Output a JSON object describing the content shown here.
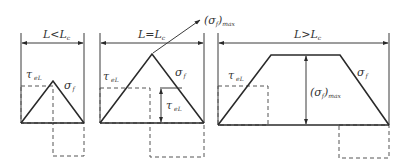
{
  "panels": [
    {
      "id": "short",
      "dimension_label": "L<L",
      "dimension_sub": "c",
      "tau_label": "τ",
      "tau_sub": "eL",
      "sigma_label": "σ",
      "sigma_sub": "f",
      "shape": "triangle"
    },
    {
      "id": "critical",
      "dimension_label": "L=L",
      "dimension_sub": "c",
      "tau_label": "τ",
      "tau_sub": "eL",
      "tau_inner_label": "τ",
      "tau_inner_sub": "eL",
      "sigma_label": "σ",
      "sigma_sub": "f",
      "max_label": "(σ",
      "max_sub": "f",
      "max_close": ")",
      "max_sub2": "max",
      "shape": "triangle"
    },
    {
      "id": "long",
      "dimension_label": "L>L",
      "dimension_sub": "c",
      "tau_label": "τ",
      "tau_sub": "eL",
      "sigma_label": "σ",
      "sigma_sub": "f",
      "max_label": "(σ",
      "max_sub": "f",
      "max_close": ")",
      "max_sub2": "max",
      "shape": "trapezoid"
    }
  ],
  "colors": {
    "line": "#2a2a2a",
    "dashed": "#555555",
    "background": "#ffffff"
  }
}
